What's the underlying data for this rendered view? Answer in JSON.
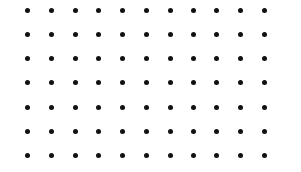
{
  "dot_grid": {
    "columns": 11,
    "rows": 7,
    "x_positions": [
      27,
      51,
      75,
      98,
      122,
      146,
      170,
      193,
      216,
      240,
      264
    ],
    "y_positions": [
      10,
      34,
      58,
      82,
      107,
      131,
      155
    ],
    "dot_color": "#111111",
    "background": "#ffffff"
  }
}
